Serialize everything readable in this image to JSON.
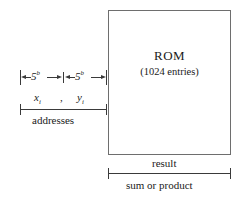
{
  "diagram": {
    "title_semantic": "rom-lookup-table-block-diagram",
    "background_color": "#ffffff",
    "line_color": "#3a3a3a",
    "box_border_color": "#6e6e6e",
    "text_color": "#1a1a1a"
  },
  "rom": {
    "title": "ROM",
    "subtitle": "(1024 entries)"
  },
  "inputs": {
    "width_label_left_base": "5",
    "width_label_left_exp": "b",
    "width_label_right_base": "5",
    "width_label_right_exp": "b",
    "var_left_base": "x",
    "var_left_sub": "i",
    "separator": ",",
    "var_right_base": "y",
    "var_right_sub": "i",
    "bracket_label": "addresses"
  },
  "output": {
    "top_label": "result",
    "bottom_label": "sum or product"
  }
}
